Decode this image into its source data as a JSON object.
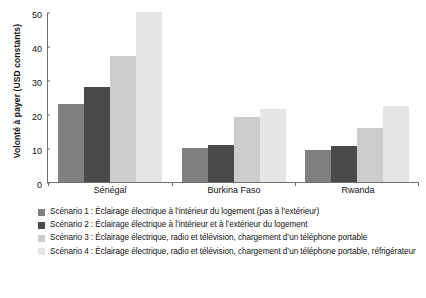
{
  "chart_data": {
    "type": "bar",
    "title": "",
    "xlabel": "",
    "ylabel": "Volonté à payer (USD constants)",
    "ylim": [
      0,
      50
    ],
    "yticks": [
      0,
      10,
      20,
      30,
      40,
      50
    ],
    "ytick_labels": [
      "0",
      "10",
      "20",
      "30",
      "40",
      "50"
    ],
    "grid": false,
    "legend_position": "below",
    "categories": [
      "Sénégal",
      "Burkina Faso",
      "Rwanda"
    ],
    "series": [
      {
        "name": "Scénario 1 : Éclairage électrique à l’intérieur du logement (pas à l’extérieur)",
        "short_name": "Scénario 1",
        "color": "#808080",
        "values": [
          23,
          10,
          9.5
        ]
      },
      {
        "name": "Scénario 2 : Éclairage électrique à l’intérieur et à l’extérieur du logement",
        "short_name": "Scénario 2",
        "color": "#4a4a4a",
        "values": [
          28,
          11,
          10.5
        ]
      },
      {
        "name": "Scénario 3 : Éclairage électrique, radio et télévision, chargement d’un téléphone portable",
        "short_name": "Scénario 3",
        "color": "#cccccc",
        "values": [
          37,
          19,
          16
        ]
      },
      {
        "name": "Scénario 4 : Éclairage électrique, radio et télévision, chargement d’un téléphone portable, réfrigérateur",
        "short_name": "Scénario 4",
        "color": "#e6e6e6",
        "values": [
          50,
          21.5,
          22.5
        ]
      }
    ]
  },
  "colors": {
    "axis": "#6f6f6f",
    "text": "#111111",
    "background": "#ffffff"
  }
}
